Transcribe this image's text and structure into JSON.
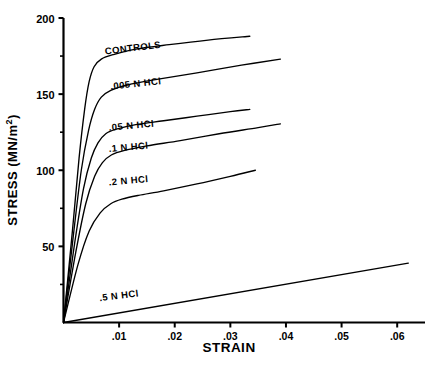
{
  "chart_data": {
    "type": "line",
    "title": "",
    "xlabel": "STRAIN",
    "ylabel": "STRESS (MN/m²)",
    "xlim": [
      0,
      0.065
    ],
    "ylim": [
      0,
      200
    ],
    "grid": false,
    "legend_position": "inline-labels",
    "xticks": [
      0.01,
      0.02,
      0.03,
      0.04,
      0.05,
      0.06
    ],
    "xtick_labels": [
      ".01",
      ".02",
      ".03",
      ".04",
      ".05",
      ".06"
    ],
    "yticks": [
      50,
      100,
      150,
      200
    ],
    "ytick_labels": [
      "50",
      "100",
      "150",
      "200"
    ],
    "yminorticks": [
      25,
      75,
      125,
      175
    ],
    "series": [
      {
        "name": "CONTROLS",
        "label": "CONTROLS",
        "label_x": 0.0075,
        "label_y": 176,
        "label_rotation": -7,
        "points": [
          [
            0.0,
            0.0
          ],
          [
            0.0016,
            60.0
          ],
          [
            0.0028,
            108.0
          ],
          [
            0.0038,
            140.0
          ],
          [
            0.0046,
            158.0
          ],
          [
            0.0055,
            168.0
          ],
          [
            0.0068,
            173.0
          ],
          [
            0.009,
            176.0
          ],
          [
            0.013,
            179.5
          ],
          [
            0.019,
            182.5
          ],
          [
            0.026,
            185.5
          ],
          [
            0.0335,
            188.0
          ]
        ]
      },
      {
        "name": ".005 N HCl",
        "label": ".005  N  HCl",
        "label_x": 0.0085,
        "label_y": 153,
        "label_rotation": -6,
        "points": [
          [
            0.0,
            0.0
          ],
          [
            0.0018,
            58.0
          ],
          [
            0.0032,
            100.0
          ],
          [
            0.0045,
            126.0
          ],
          [
            0.0056,
            140.0
          ],
          [
            0.0068,
            148.0
          ],
          [
            0.0085,
            152.5
          ],
          [
            0.0115,
            156.0
          ],
          [
            0.0165,
            159.5
          ],
          [
            0.024,
            164.0
          ],
          [
            0.032,
            169.0
          ],
          [
            0.039,
            173.0
          ]
        ]
      },
      {
        "name": ".05 N HCl",
        "label": ".05  N  HCl",
        "label_x": 0.0082,
        "label_y": 126,
        "label_rotation": -5,
        "points": [
          [
            0.0,
            0.0
          ],
          [
            0.002,
            52.0
          ],
          [
            0.0036,
            88.0
          ],
          [
            0.005,
            108.0
          ],
          [
            0.0062,
            118.0
          ],
          [
            0.0076,
            124.0
          ],
          [
            0.0095,
            127.0
          ],
          [
            0.013,
            130.0
          ],
          [
            0.018,
            132.5
          ],
          [
            0.024,
            135.5
          ],
          [
            0.03,
            138.5
          ],
          [
            0.0335,
            140.0
          ]
        ]
      },
      {
        "name": ".1 N HCl",
        "label": ".1  N  HCl",
        "label_x": 0.0082,
        "label_y": 112,
        "label_rotation": -5,
        "points": [
          [
            0.0,
            0.0
          ],
          [
            0.0022,
            46.0
          ],
          [
            0.004,
            78.0
          ],
          [
            0.0056,
            96.0
          ],
          [
            0.007,
            105.0
          ],
          [
            0.0086,
            110.0
          ],
          [
            0.011,
            113.0
          ],
          [
            0.015,
            116.0
          ],
          [
            0.021,
            119.5
          ],
          [
            0.028,
            124.0
          ],
          [
            0.035,
            128.0
          ],
          [
            0.039,
            130.5
          ]
        ]
      },
      {
        "name": ".2 N HCl",
        "label": ".2  N  HCl",
        "label_x": 0.0082,
        "label_y": 90,
        "label_rotation": -5,
        "points": [
          [
            0.0,
            0.0
          ],
          [
            0.0026,
            38.0
          ],
          [
            0.0046,
            60.0
          ],
          [
            0.0066,
            72.0
          ],
          [
            0.0085,
            78.0
          ],
          [
            0.0105,
            81.0
          ],
          [
            0.0135,
            83.5
          ],
          [
            0.018,
            86.5
          ],
          [
            0.024,
            91.0
          ],
          [
            0.03,
            96.0
          ],
          [
            0.0345,
            100.0
          ]
        ]
      },
      {
        "name": ".5 N HCl",
        "label": ".5  N  HCl",
        "label_x": 0.0065,
        "label_y": 14,
        "label_rotation": -7,
        "points": [
          [
            0.0,
            0.0
          ],
          [
            0.062,
            39.0
          ]
        ]
      }
    ]
  },
  "axes": {
    "x_axis_name": "strain-axis",
    "y_axis_name": "stress-axis"
  }
}
